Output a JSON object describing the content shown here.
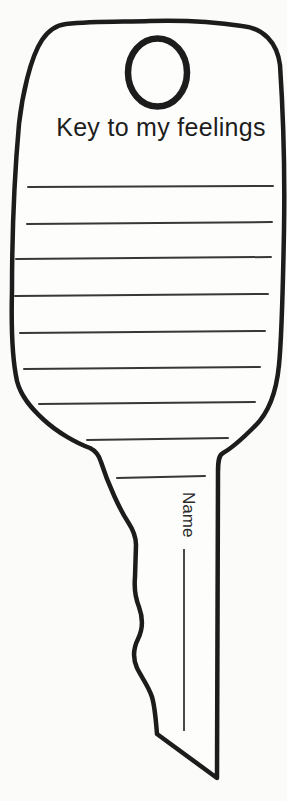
{
  "document": {
    "title": "Key to my feelings",
    "name_label": "Name"
  },
  "colors": {
    "ink": "#1c1c1c",
    "rule": "#383838",
    "paper": "#fdfdfc",
    "page_background": "#fbfbf9"
  },
  "writing_lines": [
    {
      "x1": 28,
      "y1": 187,
      "x2": 273,
      "y2": 186
    },
    {
      "x1": 27,
      "y1": 224,
      "x2": 272,
      "y2": 222
    },
    {
      "x1": 16,
      "y1": 259,
      "x2": 271,
      "y2": 257
    },
    {
      "x1": 15,
      "y1": 296,
      "x2": 268,
      "y2": 294
    },
    {
      "x1": 20,
      "y1": 333,
      "x2": 265,
      "y2": 331
    },
    {
      "x1": 24,
      "y1": 369,
      "x2": 260,
      "y2": 367
    },
    {
      "x1": 39,
      "y1": 404,
      "x2": 255,
      "y2": 402
    },
    {
      "x1": 87,
      "y1": 440,
      "x2": 228,
      "y2": 438
    },
    {
      "x1": 117,
      "y1": 478,
      "x2": 205,
      "y2": 476
    }
  ]
}
